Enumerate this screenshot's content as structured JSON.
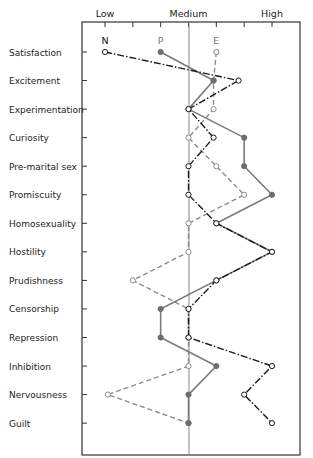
{
  "chart_data": {
    "type": "line",
    "title": "",
    "xlabel": "",
    "ylabel": "",
    "x_axis": {
      "tick_labels": [
        "Low",
        "Medium",
        "High"
      ],
      "tick_label_values": [
        1,
        4,
        7
      ],
      "range": [
        1,
        7
      ],
      "tick_count": 7
    },
    "categories": [
      "Satisfaction",
      "Excitement",
      "Experimentation",
      "Curiosity",
      "Pre-marital sex",
      "Promiscuity",
      "Homosexuality",
      "Hostility",
      "Prudishness",
      "Censorship",
      "Repression",
      "Inhibition",
      "Nervousness",
      "Guilt"
    ],
    "series": [
      {
        "name": "N",
        "style": "dash-dot black, open circles",
        "color": "#1a1a1a",
        "values": [
          1,
          5.8,
          4,
          4.9,
          4,
          4,
          5,
          7,
          5,
          4,
          4,
          7,
          6,
          7
        ]
      },
      {
        "name": "P",
        "style": "solid grey, filled circles",
        "color": "#777777",
        "values": [
          3,
          4.9,
          4,
          6,
          6,
          7,
          5,
          7,
          5,
          3,
          3,
          5,
          4,
          4
        ]
      },
      {
        "name": "E",
        "style": "dashed grey, open circles",
        "color": "#8a8a8a",
        "values": [
          5,
          4.9,
          4.9,
          4,
          5,
          6,
          4,
          4,
          2,
          4,
          4,
          4,
          1.1,
          4
        ]
      }
    ],
    "reference_line": {
      "value": 4,
      "label": "Medium"
    },
    "grid": false,
    "legend": "series letters N, P, E placed above first data row"
  }
}
